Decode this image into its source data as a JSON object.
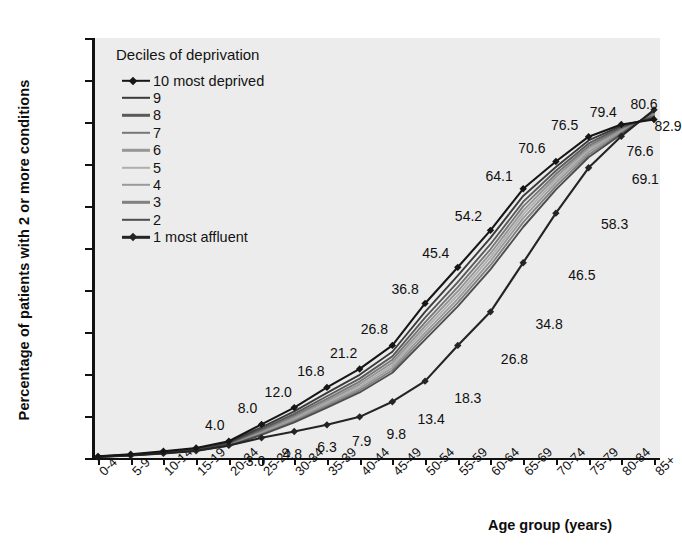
{
  "chart_data": {
    "type": "line",
    "title": "",
    "xlabel": "Age group (years)",
    "ylabel": "Percentage of patients with 2 or more conditions",
    "legend_title": "Deciles of deprivation",
    "legend_position": "top-left inside plot",
    "grid": false,
    "ylim": [
      0,
      100
    ],
    "ytick_labels": [
      "0",
      "10",
      "20",
      "30",
      "40",
      "50",
      "60",
      "70",
      "80",
      "90",
      "100"
    ],
    "ytick_values": [
      0,
      10,
      20,
      30,
      40,
      50,
      60,
      70,
      80,
      90,
      100
    ],
    "categories": [
      "0-4",
      "5-9",
      "10-14",
      "15-19",
      "20-24",
      "25-29",
      "30-34",
      "35-39",
      "40-44",
      "45-49",
      "50-54",
      "55-59",
      "60-64",
      "65-69",
      "70-74",
      "75-79",
      "80-84",
      "85+"
    ],
    "series": [
      {
        "name": "10 most deprived",
        "legend_label": "10 most deprived",
        "color": "#161616",
        "markers": true,
        "values": [
          0.4,
          0.9,
          1.6,
          2.4,
          4.0,
          8.0,
          12.0,
          16.8,
          21.2,
          26.8,
          36.8,
          45.4,
          54.2,
          64.1,
          70.6,
          76.5,
          79.4,
          80.6
        ],
        "labelled_points": [
          {
            "category": "20-24",
            "value": 4.0,
            "label": "4.0"
          },
          {
            "category": "25-29",
            "value": 8.0,
            "label": "8.0"
          },
          {
            "category": "30-34",
            "value": 12.0,
            "label": "12.0"
          },
          {
            "category": "35-39",
            "value": 16.8,
            "label": "16.8"
          },
          {
            "category": "40-44",
            "value": 21.2,
            "label": "21.2"
          },
          {
            "category": "45-49",
            "value": 26.8,
            "label": "26.8"
          },
          {
            "category": "50-54",
            "value": 36.8,
            "label": "36.8"
          },
          {
            "category": "55-59",
            "value": 45.4,
            "label": "45.4"
          },
          {
            "category": "60-64",
            "value": 54.2,
            "label": "54.2"
          },
          {
            "category": "65-69",
            "value": 64.1,
            "label": "64.1"
          },
          {
            "category": "70-74",
            "value": 70.6,
            "label": "70.6"
          },
          {
            "category": "75-79",
            "value": 76.5,
            "label": "76.5"
          },
          {
            "category": "80-84",
            "value": 79.4,
            "label": "79.4"
          },
          {
            "category": "85+",
            "value": 80.6,
            "label": "80.6"
          }
        ]
      },
      {
        "name": "9",
        "legend_label": "9",
        "color": "#3b3b3b",
        "markers": false,
        "values": [
          0.35,
          0.8,
          1.4,
          2.2,
          3.7,
          7.3,
          11.1,
          15.5,
          19.8,
          25.3,
          34.8,
          43.4,
          52.4,
          62.4,
          69.3,
          75.6,
          79.1,
          81.0
        ]
      },
      {
        "name": "8",
        "legend_label": "8",
        "color": "#5a5a5a",
        "markers": false,
        "values": [
          0.33,
          0.75,
          1.35,
          2.1,
          3.5,
          6.9,
          10.5,
          14.7,
          18.9,
          24.2,
          33.4,
          41.9,
          50.9,
          61.0,
          68.4,
          74.9,
          78.8,
          81.3
        ]
      },
      {
        "name": "7",
        "legend_label": "7",
        "color": "#777777",
        "markers": false,
        "values": [
          0.32,
          0.72,
          1.3,
          2.0,
          3.4,
          6.6,
          10.1,
          14.1,
          18.2,
          23.4,
          32.3,
          40.7,
          49.7,
          59.9,
          67.6,
          74.3,
          78.5,
          81.5
        ]
      },
      {
        "name": "6",
        "legend_label": "6",
        "color": "#969696",
        "markers": false,
        "values": [
          0.3,
          0.7,
          1.25,
          1.95,
          3.3,
          6.3,
          9.7,
          13.6,
          17.6,
          22.7,
          31.4,
          39.7,
          48.7,
          58.9,
          66.9,
          73.8,
          78.2,
          81.7
        ]
      },
      {
        "name": "5",
        "legend_label": "5",
        "color": "#aeaeae",
        "markers": false,
        "values": [
          0.3,
          0.68,
          1.22,
          1.9,
          3.2,
          6.1,
          9.4,
          13.2,
          17.1,
          22.1,
          30.6,
          38.8,
          47.8,
          58.0,
          66.2,
          73.3,
          78.0,
          81.9
        ]
      },
      {
        "name": "4",
        "legend_label": "4",
        "color": "#9a9a9a",
        "markers": false,
        "values": [
          0.29,
          0.66,
          1.2,
          1.85,
          3.1,
          5.9,
          9.1,
          12.8,
          16.6,
          21.5,
          29.8,
          37.9,
          46.9,
          57.1,
          65.5,
          72.8,
          77.7,
          82.1
        ]
      },
      {
        "name": "3",
        "legend_label": "3",
        "color": "#818181",
        "markers": false,
        "values": [
          0.28,
          0.64,
          1.17,
          1.8,
          3.0,
          5.7,
          8.8,
          12.4,
          16.1,
          20.9,
          29.0,
          37.0,
          45.9,
          56.1,
          64.7,
          72.2,
          77.4,
          82.3
        ]
      },
      {
        "name": "2",
        "legend_label": "2",
        "color": "#4d4d4d",
        "markers": false,
        "values": [
          0.27,
          0.62,
          1.14,
          1.75,
          2.9,
          5.5,
          8.5,
          12.0,
          15.6,
          20.3,
          28.2,
          36.1,
          44.9,
          55.0,
          63.9,
          71.6,
          77.1,
          82.6
        ]
      },
      {
        "name": "1 most affluent",
        "legend_label": "1 most affluent",
        "color": "#242424",
        "markers": true,
        "values": [
          0.25,
          0.6,
          1.1,
          1.7,
          3.0,
          4.8,
          6.3,
          7.9,
          9.8,
          13.4,
          18.3,
          26.8,
          34.8,
          46.5,
          58.3,
          69.1,
          76.6,
          82.9
        ],
        "labelled_points": [
          {
            "category": "25-29",
            "value": 3.0,
            "label": "3.0"
          },
          {
            "category": "30-34",
            "value": 4.8,
            "label": "4.8"
          },
          {
            "category": "35-39",
            "value": 6.3,
            "label": "6.3"
          },
          {
            "category": "40-44",
            "value": 7.9,
            "label": "7.9"
          },
          {
            "category": "45-49",
            "value": 9.8,
            "label": "9.8"
          },
          {
            "category": "50-54",
            "value": 13.4,
            "label": "13.4"
          },
          {
            "category": "55-59",
            "value": 18.3,
            "label": "18.3"
          },
          {
            "category": "60-64",
            "value": 26.8,
            "label": "26.8"
          },
          {
            "category": "65-69",
            "value": 34.8,
            "label": "34.8"
          },
          {
            "category": "70-74",
            "value": 46.5,
            "label": "46.5"
          },
          {
            "category": "75-79",
            "value": 58.3,
            "label": "58.3"
          },
          {
            "category": "80-84",
            "value": 69.1,
            "label": "69.1"
          },
          {
            "category": "85+",
            "value": 76.6,
            "label": "76.6"
          },
          {
            "category": "85+ upper",
            "value": 82.9,
            "label": "82.9"
          }
        ]
      }
    ],
    "annotations": [
      {
        "label": "4.0",
        "x_cat": "20-24",
        "y": 4.0,
        "dx": -14,
        "dy": -16
      },
      {
        "label": "3.0",
        "x_cat": "25-29",
        "y": 3.0,
        "dx": -6,
        "dy": 16
      },
      {
        "label": "8.0",
        "x_cat": "25-29",
        "y": 8.0,
        "dx": -14,
        "dy": -16
      },
      {
        "label": "4.8",
        "x_cat": "30-34",
        "y": 4.8,
        "dx": -2,
        "dy": 16
      },
      {
        "label": "12.0",
        "x_cat": "30-34",
        "y": 12.0,
        "dx": -16,
        "dy": -16
      },
      {
        "label": "6.3",
        "x_cat": "35-39",
        "y": 6.3,
        "dx": 0,
        "dy": 15
      },
      {
        "label": "16.8",
        "x_cat": "35-39",
        "y": 16.8,
        "dx": -16,
        "dy": -16
      },
      {
        "label": "7.9",
        "x_cat": "40-44",
        "y": 7.9,
        "dx": 2,
        "dy": 16
      },
      {
        "label": "21.2",
        "x_cat": "40-44",
        "y": 21.2,
        "dx": -16,
        "dy": -16
      },
      {
        "label": "9.8",
        "x_cat": "45-49",
        "y": 9.8,
        "dx": 4,
        "dy": 17
      },
      {
        "label": "26.8",
        "x_cat": "45-49",
        "y": 26.8,
        "dx": -18,
        "dy": -16
      },
      {
        "label": "13.4",
        "x_cat": "50-54",
        "y": 13.4,
        "dx": 6,
        "dy": 17
      },
      {
        "label": "36.8",
        "x_cat": "50-54",
        "y": 36.8,
        "dx": -20,
        "dy": -14
      },
      {
        "label": "18.3",
        "x_cat": "55-59",
        "y": 18.3,
        "dx": 10,
        "dy": 17
      },
      {
        "label": "45.4",
        "x_cat": "55-59",
        "y": 45.4,
        "dx": -22,
        "dy": -14
      },
      {
        "label": "26.8",
        "x_cat": "60-64",
        "y": 26.8,
        "dx": 24,
        "dy": 14
      },
      {
        "label": "54.2",
        "x_cat": "60-64",
        "y": 54.2,
        "dx": -22,
        "dy": -14
      },
      {
        "label": "34.8",
        "x_cat": "65-69",
        "y": 34.8,
        "dx": 26,
        "dy": 12
      },
      {
        "label": "64.1",
        "x_cat": "65-69",
        "y": 64.1,
        "dx": -24,
        "dy": -13
      },
      {
        "label": "46.5",
        "x_cat": "70-74",
        "y": 46.5,
        "dx": 26,
        "dy": 12
      },
      {
        "label": "70.6",
        "x_cat": "70-74",
        "y": 70.6,
        "dx": -24,
        "dy": -13
      },
      {
        "label": "58.3",
        "x_cat": "75-79",
        "y": 58.3,
        "dx": 26,
        "dy": 11
      },
      {
        "label": "76.5",
        "x_cat": "75-79",
        "y": 76.5,
        "dx": -24,
        "dy": -12
      },
      {
        "label": "69.1",
        "x_cat": "80-84",
        "y": 69.1,
        "dx": 24,
        "dy": 11
      },
      {
        "label": "79.4",
        "x_cat": "80-84",
        "y": 79.4,
        "dx": -18,
        "dy": -13
      },
      {
        "label": "76.6",
        "x_cat": "85+",
        "y": 76.6,
        "dx": -14,
        "dy": 15
      },
      {
        "label": "80.6",
        "x_cat": "85+",
        "y": 80.6,
        "dx": -10,
        "dy": -15
      },
      {
        "label": "82.9",
        "x_cat": "85+",
        "y": 82.9,
        "dx": 14,
        "dy": 16
      }
    ]
  }
}
